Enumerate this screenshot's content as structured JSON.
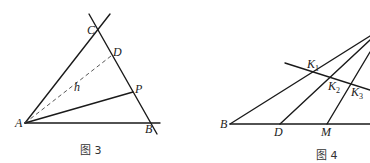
{
  "figure3": {
    "caption": "图 3",
    "labels": {
      "A": "A",
      "B": "B",
      "C": "C",
      "D": "D",
      "P": "P",
      "h": "h"
    }
  },
  "figure4": {
    "caption": "图 4",
    "labels": {
      "B": "B",
      "D": "D",
      "M": "M",
      "K1": "K",
      "K1_sub": "1",
      "K2": "K",
      "K2_sub": "2",
      "K3": "K",
      "K3_sub": "3"
    }
  }
}
